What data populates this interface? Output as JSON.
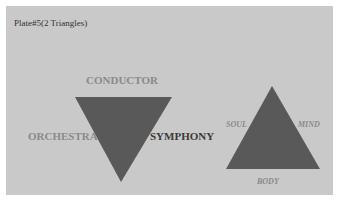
{
  "title": "Plate#5(2 Triangles)",
  "colors": {
    "background": "#c9c9c9",
    "triangle_fill": "#595959",
    "label_gray": "#8a8a8a",
    "label_dark": "#3a3a3a"
  },
  "triangle_left": {
    "orientation": "inverted",
    "top_label": "CONDUCTOR",
    "left_label": "ORCHESTRA",
    "right_label": "SYMPHONY"
  },
  "triangle_right": {
    "orientation": "upright",
    "left_label": "SOUL",
    "right_label": "MIND",
    "bottom_label": "BODY"
  }
}
